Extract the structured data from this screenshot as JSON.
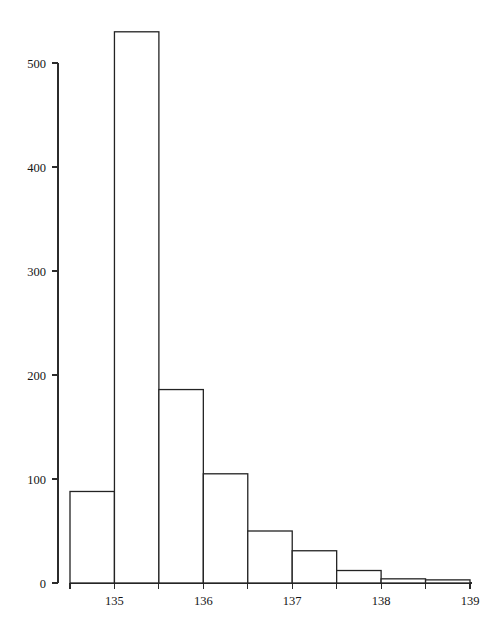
{
  "chart_data": {
    "type": "bar",
    "title": "",
    "subtitle": "",
    "xlabel": "",
    "ylabel": "",
    "grid": false,
    "legend": false,
    "legend_position": "none",
    "bin_width": 0.5,
    "bin_edges": [
      134.5,
      135.0,
      135.5,
      136.0,
      136.5,
      137.0,
      137.5,
      138.0,
      138.5,
      139.0
    ],
    "categories": [
      "134.5-135.0",
      "135.0-135.5",
      "135.5-136.0",
      "136.0-136.5",
      "136.5-137.0",
      "137.0-137.5",
      "137.5-138.0",
      "138.0-138.5",
      "138.5-139.0"
    ],
    "values": [
      88,
      530,
      186,
      105,
      50,
      31,
      12,
      4,
      3
    ],
    "bar_colors": {
      "fill": "#ffffff",
      "stroke": "#232323"
    },
    "xlim": [
      134.5,
      139.0
    ],
    "ylim": [
      0,
      545
    ],
    "x_ticks": [
      135,
      136,
      137,
      138,
      139
    ],
    "x_tick_labels": [
      "135",
      "136",
      "137",
      "138",
      "139"
    ],
    "y_ticks": [
      0,
      100,
      200,
      300,
      400,
      500
    ],
    "y_tick_labels": [
      "0",
      "100",
      "200",
      "300",
      "400",
      "500"
    ]
  },
  "axes": {
    "y_axis_name": "y-axis",
    "x_axis_name": "x-axis"
  }
}
